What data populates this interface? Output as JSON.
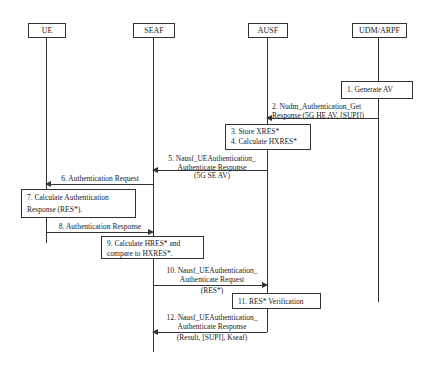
{
  "entities": [
    {
      "id": "ue",
      "label": "UE"
    },
    {
      "id": "seaf",
      "label": "SEAF"
    },
    {
      "id": "ausf",
      "label": "AUSF"
    },
    {
      "id": "udm",
      "label": "UDM/ARPF"
    }
  ],
  "steps": {
    "s1": {
      "line1": "1. Generate AV"
    },
    "s2": {
      "line1": "2. Nudm_Authentication_Get",
      "line2": "Response (5G HE AV, [SUPI])"
    },
    "s3": {
      "line1": "3. Store XRES*",
      "line2": "4. Calculate HXRES*"
    },
    "s5": {
      "line1": "5. Nausf_UEAuthentication_",
      "line2": "Authenticate Response",
      "line3": "(5G SE AV)"
    },
    "s6": {
      "line1": "6. Authentication Request"
    },
    "s7": {
      "line1": "7. Calculate Authentication",
      "line2": "Response (RES*)."
    },
    "s8": {
      "line1": "8. Authentication Response"
    },
    "s9": {
      "line1": "9. Calculate HRES* and",
      "line2": "compare to HXRES*."
    },
    "s10": {
      "line1": "10. Nausf_UEAuthentication_",
      "line2": "Authenticate Request",
      "line3": "(RES*)"
    },
    "s11": {
      "line1": "11. RES* Verification"
    },
    "s12": {
      "line1": "12. Nausf_UEAuthentication_",
      "line2": "Authenticate Response",
      "line3": "(Result, [SUPI], Kseaf)"
    }
  }
}
